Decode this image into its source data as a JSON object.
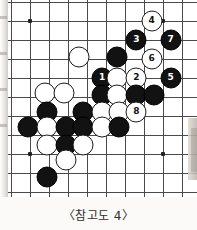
{
  "figure": {
    "caption": "〈참고도 4〉",
    "kind": "go-board-diagram",
    "board": {
      "origin_x": 11,
      "origin_y": 2,
      "spacing": 19,
      "cols": 10,
      "rows": 10,
      "line_color": "#4a4a4a",
      "background": "#ffffff",
      "star_points": [
        {
          "col": 1,
          "row": 1
        },
        {
          "col": 8,
          "row": 1
        },
        {
          "col": 1,
          "row": 8
        },
        {
          "col": 8,
          "row": 8
        }
      ]
    },
    "colors": {
      "black_stone": "#121212",
      "white_stone": "#ffffff",
      "stone_outline": "#1b1b1b",
      "black_number_text": "#ffffff",
      "white_number_text": "#111111",
      "page_background": "#fbfaf8"
    },
    "stones": [
      {
        "color": "white",
        "col": 7.4,
        "row": 1.0,
        "label": "4"
      },
      {
        "color": "black",
        "col": 6.6,
        "row": 2.0,
        "label": "3"
      },
      {
        "color": "black",
        "col": 8.4,
        "row": 2.0,
        "label": "7"
      },
      {
        "color": "black",
        "col": 5.6,
        "row": 2.9,
        "label": ""
      },
      {
        "color": "white",
        "col": 3.6,
        "row": 2.9,
        "label": ""
      },
      {
        "color": "white",
        "col": 7.4,
        "row": 3.0,
        "label": "6"
      },
      {
        "color": "black",
        "col": 4.8,
        "row": 4.0,
        "label": "1"
      },
      {
        "color": "white",
        "col": 5.6,
        "row": 4.0,
        "label": ""
      },
      {
        "color": "white",
        "col": 6.6,
        "row": 4.0,
        "label": "2"
      },
      {
        "color": "black",
        "col": 8.4,
        "row": 4.0,
        "label": "5"
      },
      {
        "color": "white",
        "col": 1.8,
        "row": 4.8,
        "label": ""
      },
      {
        "color": "white",
        "col": 2.8,
        "row": 4.8,
        "label": ""
      },
      {
        "color": "black",
        "col": 4.8,
        "row": 4.9,
        "label": ""
      },
      {
        "color": "white",
        "col": 5.6,
        "row": 4.9,
        "label": ""
      },
      {
        "color": "black",
        "col": 6.6,
        "row": 4.9,
        "label": ""
      },
      {
        "color": "black",
        "col": 7.5,
        "row": 4.9,
        "label": ""
      },
      {
        "color": "black",
        "col": 1.9,
        "row": 5.8,
        "label": ""
      },
      {
        "color": "black",
        "col": 3.8,
        "row": 5.8,
        "label": ""
      },
      {
        "color": "white",
        "col": 4.8,
        "row": 5.8,
        "label": ""
      },
      {
        "color": "white",
        "col": 5.7,
        "row": 5.8,
        "label": ""
      },
      {
        "color": "white",
        "col": 6.6,
        "row": 5.8,
        "label": "8"
      },
      {
        "color": "black",
        "col": 0.9,
        "row": 6.6,
        "label": ""
      },
      {
        "color": "white",
        "col": 1.9,
        "row": 6.6,
        "label": ""
      },
      {
        "color": "black",
        "col": 2.9,
        "row": 6.6,
        "label": ""
      },
      {
        "color": "black",
        "col": 3.8,
        "row": 6.6,
        "label": ""
      },
      {
        "color": "white",
        "col": 4.8,
        "row": 6.6,
        "label": ""
      },
      {
        "color": "black",
        "col": 5.7,
        "row": 6.6,
        "label": ""
      },
      {
        "color": "white",
        "col": 1.9,
        "row": 7.5,
        "label": ""
      },
      {
        "color": "black",
        "col": 2.9,
        "row": 7.5,
        "label": ""
      },
      {
        "color": "white",
        "col": 3.8,
        "row": 7.5,
        "label": ""
      },
      {
        "color": "white",
        "col": 2.9,
        "row": 8.3,
        "label": ""
      },
      {
        "color": "black",
        "col": 1.9,
        "row": 9.2,
        "label": ""
      }
    ]
  }
}
